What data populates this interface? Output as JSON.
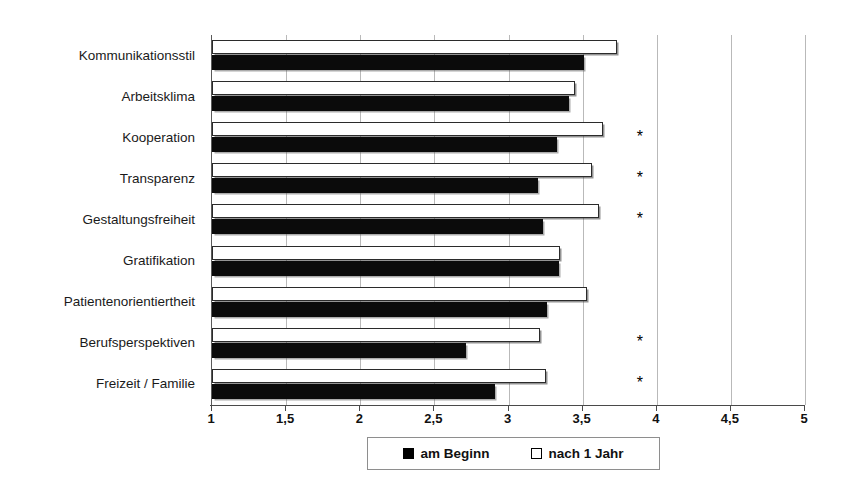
{
  "chart_data": {
    "type": "bar",
    "orientation": "horizontal",
    "title": "",
    "subtitle": "",
    "xlabel": "",
    "ylabel": "",
    "xlim": [
      1,
      5
    ],
    "xticks": [
      1,
      1.5,
      2,
      2.5,
      3,
      3.5,
      4,
      4.5,
      5
    ],
    "xticklabels": [
      "1",
      "1,5",
      "2",
      "2,5",
      "3",
      "3,5",
      "4",
      "4,5",
      "5"
    ],
    "grid": true,
    "grid_axis": "x",
    "legend_position": "bottom",
    "categories": [
      "Kommunikationsstil",
      "Arbeitsklima",
      "Kooperation",
      "Transparenz",
      "Gestaltungsfreiheit",
      "Gratifikation",
      "Patientenorientiertheit",
      "Berufsperspektiven",
      "Freizeit / Familie"
    ],
    "series": [
      {
        "name": "am Beginn",
        "style": "filled-black",
        "color": "#000000",
        "values": [
          3.51,
          3.41,
          3.33,
          3.2,
          3.23,
          3.34,
          3.26,
          2.71,
          2.91
        ]
      },
      {
        "name": "nach 1 Jahr",
        "style": "outlined-white",
        "color": "#ffffff",
        "values": [
          3.73,
          3.45,
          3.64,
          3.56,
          3.61,
          3.35,
          3.53,
          3.21,
          3.25
        ]
      }
    ],
    "annotations": {
      "symbol": "*",
      "meaning": "significant difference",
      "marked_categories": [
        "Kooperation",
        "Transparenz",
        "Gestaltungsfreiheit",
        "Berufsperspektiven",
        "Freizeit / Familie"
      ],
      "marked_indices": [
        2,
        3,
        4,
        7,
        8
      ]
    }
  },
  "legend": {
    "items": [
      {
        "label": "am Beginn",
        "swatch": "filled"
      },
      {
        "label": "nach 1 Jahr",
        "swatch": "hollow"
      }
    ]
  }
}
